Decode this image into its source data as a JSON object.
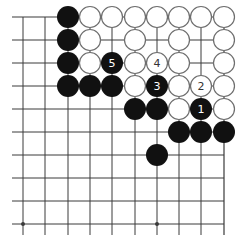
{
  "diagram": {
    "type": "go-board-fragment",
    "corner": "top-right",
    "columns": 10,
    "rows": 10,
    "col_x": [
      23,
      45,
      68,
      90,
      112,
      135,
      157,
      179,
      201,
      224
    ],
    "row_y": [
      17,
      40,
      63,
      86,
      109,
      132,
      155,
      178,
      201,
      224
    ],
    "left_extend_to": 12,
    "bottom_extend_to": 235,
    "stone_radius": 11,
    "hoshi": [
      [
        0,
        9
      ],
      [
        6,
        9
      ]
    ],
    "colors": {
      "line": "#3a3a3a",
      "black_stone": "#111111",
      "white_stone_fill": "#ffffff",
      "white_stone_stroke": "#6e6e6e",
      "label_on_black": "#ffffff",
      "label_on_white": "#333333"
    },
    "stones": [
      {
        "col": 2,
        "row": 0,
        "color": "black",
        "label": ""
      },
      {
        "col": 3,
        "row": 0,
        "color": "white",
        "label": ""
      },
      {
        "col": 4,
        "row": 0,
        "color": "white",
        "label": ""
      },
      {
        "col": 5,
        "row": 0,
        "color": "white",
        "label": ""
      },
      {
        "col": 6,
        "row": 0,
        "color": "white",
        "label": ""
      },
      {
        "col": 7,
        "row": 0,
        "color": "white",
        "label": ""
      },
      {
        "col": 8,
        "row": 0,
        "color": "white",
        "label": ""
      },
      {
        "col": 9,
        "row": 0,
        "color": "white",
        "label": ""
      },
      {
        "col": 2,
        "row": 1,
        "color": "black",
        "label": ""
      },
      {
        "col": 3,
        "row": 1,
        "color": "white",
        "label": ""
      },
      {
        "col": 5,
        "row": 1,
        "color": "white",
        "label": ""
      },
      {
        "col": 7,
        "row": 1,
        "color": "white",
        "label": ""
      },
      {
        "col": 9,
        "row": 1,
        "color": "white",
        "label": ""
      },
      {
        "col": 2,
        "row": 2,
        "color": "black",
        "label": ""
      },
      {
        "col": 3,
        "row": 2,
        "color": "white",
        "label": ""
      },
      {
        "col": 4,
        "row": 2,
        "color": "black",
        "label": "5"
      },
      {
        "col": 5,
        "row": 2,
        "color": "white",
        "label": ""
      },
      {
        "col": 6,
        "row": 2,
        "color": "white",
        "label": "4"
      },
      {
        "col": 7,
        "row": 2,
        "color": "white",
        "label": ""
      },
      {
        "col": 9,
        "row": 2,
        "color": "white",
        "label": ""
      },
      {
        "col": 2,
        "row": 3,
        "color": "black",
        "label": ""
      },
      {
        "col": 3,
        "row": 3,
        "color": "black",
        "label": ""
      },
      {
        "col": 4,
        "row": 3,
        "color": "black",
        "label": ""
      },
      {
        "col": 5,
        "row": 3,
        "color": "white",
        "label": ""
      },
      {
        "col": 6,
        "row": 3,
        "color": "black",
        "label": "3"
      },
      {
        "col": 7,
        "row": 3,
        "color": "white",
        "label": ""
      },
      {
        "col": 8,
        "row": 3,
        "color": "white",
        "label": "2"
      },
      {
        "col": 9,
        "row": 3,
        "color": "white",
        "label": ""
      },
      {
        "col": 5,
        "row": 4,
        "color": "black",
        "label": ""
      },
      {
        "col": 6,
        "row": 4,
        "color": "black",
        "label": ""
      },
      {
        "col": 7,
        "row": 4,
        "color": "white",
        "label": ""
      },
      {
        "col": 8,
        "row": 4,
        "color": "black",
        "label": "1"
      },
      {
        "col": 9,
        "row": 4,
        "color": "white",
        "label": ""
      },
      {
        "col": 7,
        "row": 5,
        "color": "black",
        "label": ""
      },
      {
        "col": 8,
        "row": 5,
        "color": "black",
        "label": ""
      },
      {
        "col": 9,
        "row": 5,
        "color": "black",
        "label": ""
      },
      {
        "col": 6,
        "row": 6,
        "color": "black",
        "label": ""
      }
    ]
  }
}
